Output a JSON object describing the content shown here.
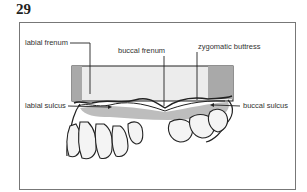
{
  "figure": {
    "number": "29",
    "labels": {
      "labial_frenum": "labial frenum",
      "buccal_frenum": "buccal frenum",
      "zygomatic_buttress": "zygomatic buttress",
      "labial_sulcus": "labial sulcus",
      "buccal_sulcus": "buccal sulcus"
    },
    "colors": {
      "frame": "#777777",
      "tray_face": "#e8e8e8",
      "tray_shade": "#a9a9a9",
      "gum_shade": "#bdbdbd",
      "line": "#222222"
    }
  }
}
